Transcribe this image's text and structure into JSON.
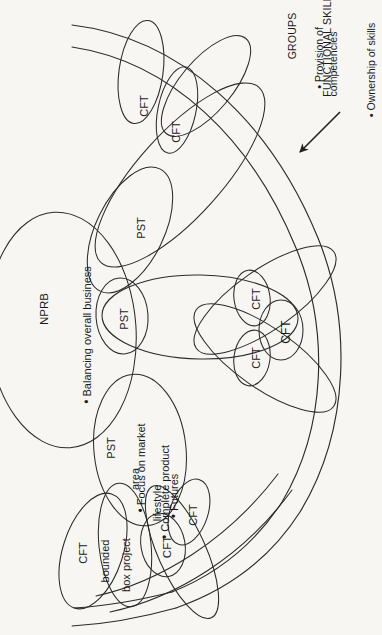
{
  "figure": {
    "background_color": "#f7f6f3",
    "stroke_color": "#2b2b2b",
    "text_color": "#1a1a1a",
    "rotation_note": "All text is rotated 90 degrees (reads bottom-to-top)"
  },
  "annotation": {
    "heading_line1": "FUNCTIONAL SKILL",
    "heading_line2": "GROUPS",
    "bullets": [
      "Provision of competencies",
      "Ownership of skills"
    ],
    "bullet_1_line_1": "Provision of",
    "bullet_1_line_2": "competencies",
    "bullet_2_line_1": "Ownership of skills",
    "arrow": "arrow-pointing-to-skill-group-band"
  },
  "groups": {
    "nprb": {
      "label": "NPRB",
      "bullets": [
        "Balancing overall business"
      ],
      "bullet_1": "Balancing overall business"
    },
    "pst_main": {
      "label": "PST",
      "bullets": [
        "Focus on market area",
        "Complete product lifestyle",
        "Futures"
      ],
      "bullet_1_line_1": "Focus on market",
      "bullet_1_line_2": "area",
      "bullet_2_line_1": "Complete product",
      "bullet_2_line_2": "lifestyle",
      "bullet_3_line_1": "Futures"
    },
    "cft_bounded": {
      "label": "CFT",
      "line_2": "bounded",
      "line_3": "box project"
    }
  },
  "nodes": [
    {
      "id": "cft-top-1",
      "label": "CFT"
    },
    {
      "id": "cft-top-2",
      "label": "CFT"
    },
    {
      "id": "pst-upper",
      "label": "PST"
    },
    {
      "id": "pst-center",
      "label": "PST"
    },
    {
      "id": "cft-right-upper",
      "label": "CFT"
    },
    {
      "id": "cft-right-mid",
      "label": "CFT"
    },
    {
      "id": "cft-right-lower",
      "label": "CFT"
    },
    {
      "id": "cft-lower-1",
      "label": "CFT"
    },
    {
      "id": "cft-lower-2",
      "label": "CFT"
    }
  ]
}
